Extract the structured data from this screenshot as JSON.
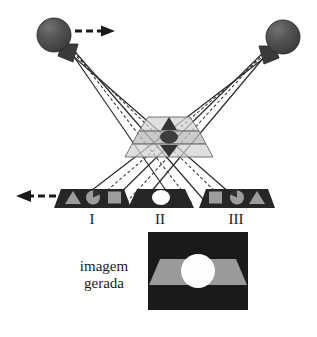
{
  "figure": {
    "title_text": "",
    "caption": {
      "line1": "imagem",
      "line2": "gerada"
    },
    "labels": {
      "one": "I",
      "two": "II",
      "three": "III"
    }
  },
  "colors": {
    "background": "#ffffff",
    "ray_solid": "#2b2b2b",
    "ray_dashed": "#3a3a3a",
    "sphere_fill": "#4a4a4a",
    "sphere_highlight": "#6d6d6d",
    "sphere_edge": "#242424",
    "detector_dark": "#262626",
    "detector_shape": "#9d9d9d",
    "detector_circle_white": "#ffffff",
    "center_plate_light": "#c9c9c9",
    "center_plate_mid": "#b0b0b0",
    "center_plate_outline": "#6a6a6a",
    "panel_background": "#1a1a1a",
    "panel_band": "#9a9a9a",
    "panel_circle": "#fdfdfd",
    "arrow": "#1a1a1a",
    "text": "#1a1a1a"
  },
  "sources": [
    {
      "name": "left-source",
      "cx": 54,
      "cy": 35,
      "r": 17,
      "arrow_direction": "right"
    },
    {
      "name": "right-source",
      "cx": 283,
      "cy": 37,
      "r": 17,
      "arrow_direction": "none"
    }
  ],
  "arrows": [
    {
      "name": "top-dashed-arrow",
      "direction": "right",
      "x1": 78,
      "y1": 31,
      "x2": 112,
      "y2": 31
    },
    {
      "name": "left-dashed-arrow",
      "direction": "left",
      "x1": 56,
      "y1": 196,
      "x2": 16,
      "y2": 196
    }
  ],
  "detectors": [
    {
      "name": "detector-I",
      "label": "I",
      "label_x": 92,
      "label_y": 223,
      "shapes": [
        "triangle",
        "circle-wedge",
        "square"
      ]
    },
    {
      "name": "detector-II",
      "label": "II",
      "label_x": 160,
      "label_y": 223,
      "shapes": [
        "circle-white"
      ]
    },
    {
      "name": "detector-III",
      "label": "III",
      "label_x": 236,
      "label_y": 223,
      "shapes": [
        "square",
        "circle-wedge",
        "triangle"
      ]
    }
  ],
  "center_stack": {
    "name": "central-plates",
    "plate_count": 3,
    "inner_shapes": [
      "triangle-dark",
      "circle-dark",
      "triangle-dark"
    ]
  },
  "generated_panel": {
    "name": "generated-image-panel",
    "x": 148,
    "y": 232,
    "width": 100,
    "height": 78,
    "contents": [
      "trapezoid-band",
      "white-circle"
    ]
  },
  "ray_paths": {
    "description": "Each source emits rays that cross at the central plate stack and diverge onto the three detectors.",
    "solid_count_per_source": 3,
    "dashed_count_per_source": 2
  }
}
